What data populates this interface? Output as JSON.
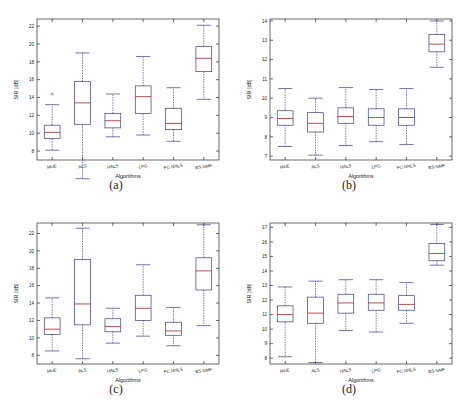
{
  "figure": {
    "title": "",
    "panel_count": 4,
    "captions": [
      "(a)",
      "(b)",
      "(c)",
      "(d)"
    ]
  },
  "chart_data": [
    {
      "type": "box",
      "title": "(a)",
      "xlabel": "Algorithms",
      "ylabel": "SIR [dB]",
      "categories": [
        "MUE",
        "ALS",
        "HALS",
        "LPG",
        "FC-NNLS",
        "BS-NMF"
      ],
      "ylim": [
        7.0,
        22.8
      ],
      "yticks": [
        8,
        10,
        12,
        14,
        16,
        18,
        20,
        22
      ],
      "grid": false,
      "legend": "none",
      "boxes": [
        {
          "label": "MUE",
          "whisker_low": 8.1,
          "q1": 9.4,
          "median": 10.1,
          "q3": 10.9,
          "whisker_high": 13.2,
          "outliers": [
            14.4
          ]
        },
        {
          "label": "ALS",
          "whisker_low": 4.9,
          "q1": 11.0,
          "median": 13.4,
          "q3": 15.8,
          "whisker_high": 19.0,
          "outliers": []
        },
        {
          "label": "HALS",
          "whisker_low": 9.6,
          "q1": 10.6,
          "median": 11.4,
          "q3": 12.2,
          "whisker_high": 14.4,
          "outliers": []
        },
        {
          "label": "LPG",
          "whisker_low": 9.8,
          "q1": 12.2,
          "median": 14.1,
          "q3": 15.3,
          "whisker_high": 18.6,
          "outliers": []
        },
        {
          "label": "FC-NNLS",
          "whisker_low": 9.1,
          "q1": 10.4,
          "median": 11.1,
          "q3": 12.8,
          "whisker_high": 15.1,
          "outliers": []
        },
        {
          "label": "BS-NMF",
          "whisker_low": 13.8,
          "q1": 16.9,
          "median": 18.4,
          "q3": 19.7,
          "whisker_high": 22.1,
          "outliers": []
        }
      ]
    },
    {
      "type": "box",
      "title": "(b)",
      "xlabel": "Algorithms",
      "ylabel": "SIR [dB]",
      "categories": [
        "MUE",
        "ALS",
        "HALS",
        "LPG",
        "FC-NNLS",
        "BS-NMF"
      ],
      "ylim": [
        6.8,
        14.1
      ],
      "yticks": [
        7,
        8,
        9,
        10,
        11,
        12,
        13,
        14
      ],
      "grid": false,
      "legend": "none",
      "boxes": [
        {
          "label": "MUE",
          "whisker_low": 7.5,
          "q1": 8.6,
          "median": 8.95,
          "q3": 9.35,
          "whisker_high": 10.5,
          "outliers": []
        },
        {
          "label": "ALS",
          "whisker_low": 7.05,
          "q1": 8.25,
          "median": 8.7,
          "q3": 9.25,
          "whisker_high": 10.0,
          "outliers": []
        },
        {
          "label": "HALS",
          "whisker_low": 7.55,
          "q1": 8.7,
          "median": 9.05,
          "q3": 9.5,
          "whisker_high": 10.55,
          "outliers": []
        },
        {
          "label": "LPG",
          "whisker_low": 7.75,
          "q1": 8.6,
          "median": 9.0,
          "q3": 9.45,
          "whisker_high": 10.45,
          "outliers": []
        },
        {
          "label": "FC-NNLS",
          "whisker_low": 7.6,
          "q1": 8.6,
          "median": 9.0,
          "q3": 9.45,
          "whisker_high": 10.5,
          "outliers": []
        },
        {
          "label": "BS-NMF",
          "whisker_low": 11.6,
          "q1": 12.4,
          "median": 12.8,
          "q3": 13.3,
          "whisker_high": 14.0,
          "outliers": []
        }
      ]
    },
    {
      "type": "box",
      "title": "(c)",
      "xlabel": "Algorithms",
      "ylabel": "SIR [dB]",
      "categories": [
        "MUE",
        "ALS",
        "HALS",
        "LPG",
        "FC-NNLS",
        "BS-NMF"
      ],
      "ylim": [
        7.0,
        23.2
      ],
      "yticks": [
        8,
        10,
        12,
        14,
        16,
        18,
        20,
        22
      ],
      "grid": false,
      "legend": "none",
      "boxes": [
        {
          "label": "MUE",
          "whisker_low": 8.5,
          "q1": 10.4,
          "median": 11.0,
          "q3": 12.3,
          "whisker_high": 14.6,
          "outliers": []
        },
        {
          "label": "ALS",
          "whisker_low": 7.6,
          "q1": 11.5,
          "median": 13.9,
          "q3": 19.0,
          "whisker_high": 22.6,
          "outliers": []
        },
        {
          "label": "HALS",
          "whisker_low": 9.4,
          "q1": 10.7,
          "median": 11.3,
          "q3": 12.2,
          "whisker_high": 13.4,
          "outliers": []
        },
        {
          "label": "LPG",
          "whisker_low": 10.2,
          "q1": 12.0,
          "median": 13.4,
          "q3": 14.9,
          "whisker_high": 18.4,
          "outliers": []
        },
        {
          "label": "FC-NNLS",
          "whisker_low": 9.1,
          "q1": 10.3,
          "median": 10.8,
          "q3": 11.8,
          "whisker_high": 13.5,
          "outliers": []
        },
        {
          "label": "BS-NMF",
          "whisker_low": 11.4,
          "q1": 15.5,
          "median": 17.7,
          "q3": 19.2,
          "whisker_high": 23.0,
          "outliers": []
        }
      ]
    },
    {
      "type": "box",
      "title": "(d)",
      "xlabel": "Algorithms",
      "ylabel": "SIR [dB]",
      "categories": [
        "MUE",
        "ALS",
        "HALS",
        "LPG",
        "FC-NNLS",
        "BS-NMF"
      ],
      "ylim": [
        7.6,
        17.3
      ],
      "yticks": [
        8,
        9,
        10,
        11,
        12,
        13,
        14,
        15,
        16,
        17
      ],
      "grid": false,
      "legend": "none",
      "boxes": [
        {
          "label": "MUE",
          "whisker_low": 8.1,
          "q1": 10.5,
          "median": 11.0,
          "q3": 11.6,
          "whisker_high": 12.9,
          "outliers": []
        },
        {
          "label": "ALS",
          "whisker_low": 7.7,
          "q1": 10.4,
          "median": 11.1,
          "q3": 12.2,
          "whisker_high": 13.3,
          "outliers": []
        },
        {
          "label": "HALS",
          "whisker_low": 9.9,
          "q1": 11.1,
          "median": 11.8,
          "q3": 12.4,
          "whisker_high": 13.4,
          "outliers": []
        },
        {
          "label": "LPG",
          "whisker_low": 9.8,
          "q1": 11.3,
          "median": 11.8,
          "q3": 12.4,
          "whisker_high": 13.4,
          "outliers": []
        },
        {
          "label": "FC-NNLS",
          "whisker_low": 10.4,
          "q1": 11.3,
          "median": 11.7,
          "q3": 12.3,
          "whisker_high": 13.2,
          "outliers": []
        },
        {
          "label": "BS-NMF",
          "whisker_low": 14.4,
          "q1": 14.7,
          "median": 15.2,
          "q3": 15.9,
          "whisker_high": 17.2,
          "outliers": []
        }
      ]
    }
  ],
  "colors": {
    "box": "#3a3a8a",
    "median": "#b02020",
    "axis": "#2a2a2a",
    "background": "#ffffff"
  }
}
